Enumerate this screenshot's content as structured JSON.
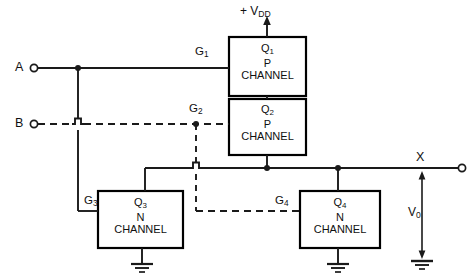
{
  "supply": {
    "label_prefix": "+ V",
    "label_sub": "DD",
    "arrow": "up-arrow"
  },
  "inputs": [
    {
      "name": "A",
      "label": "A",
      "terminal": "open-circle",
      "line_style": "solid"
    },
    {
      "name": "B",
      "label": "B",
      "terminal": "open-circle",
      "line_style": "dashed"
    }
  ],
  "gates": [
    {
      "id": "G1",
      "label": "G",
      "sub": "1",
      "line_style": "solid",
      "drives": "Q1"
    },
    {
      "id": "G2",
      "label": "G",
      "sub": "2",
      "line_style": "dashed",
      "drives": "Q2"
    },
    {
      "id": "G3",
      "label": "G",
      "sub": "3",
      "line_style": "solid",
      "drives": "Q3"
    },
    {
      "id": "G4",
      "label": "G",
      "sub": "4",
      "line_style": "dashed",
      "drives": "Q4"
    }
  ],
  "transistors": [
    {
      "id": "Q1",
      "name": "Q",
      "sub": "1",
      "type_line1": "P",
      "type_line2": "CHANNEL"
    },
    {
      "id": "Q2",
      "name": "Q",
      "sub": "2",
      "type_line1": "P",
      "type_line2": "CHANNEL"
    },
    {
      "id": "Q3",
      "name": "Q",
      "sub": "3",
      "type_line1": "N",
      "type_line2": "CHANNEL"
    },
    {
      "id": "Q4",
      "name": "Q",
      "sub": "4",
      "type_line1": "N",
      "type_line2": "CHANNEL"
    }
  ],
  "output": {
    "node_label": "X",
    "terminal": "open-circle",
    "voltage_label": "V",
    "voltage_sub": "0",
    "arrows": "double-headed-vertical",
    "reference": "ground"
  },
  "grounds": [
    {
      "for": "Q3",
      "symbol": "ground"
    },
    {
      "for": "Q4",
      "symbol": "ground"
    },
    {
      "for": "V0",
      "symbol": "ground"
    }
  ],
  "colors": {
    "wire": "#1a1a1a",
    "box_stroke": "#000000",
    "background": "#ffffff",
    "text": "#101010"
  }
}
